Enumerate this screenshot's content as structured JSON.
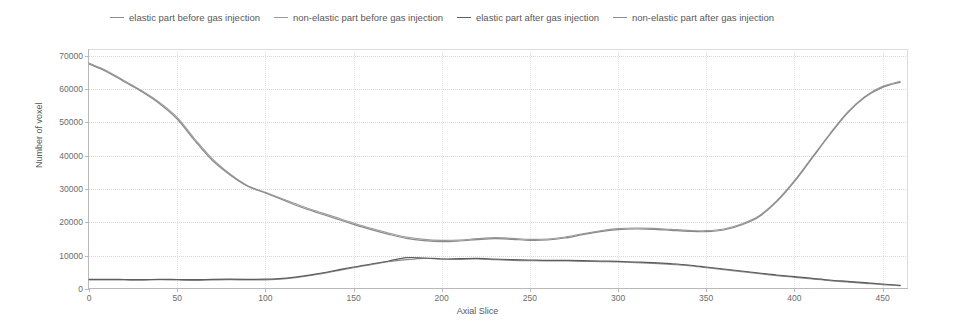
{
  "chart_data": {
    "type": "line",
    "title": "",
    "xlabel": "Axial Slice",
    "ylabel": "Number of voxel",
    "xlim": [
      0,
      465
    ],
    "ylim": [
      0,
      72000
    ],
    "xticks": [
      0,
      50,
      100,
      150,
      200,
      250,
      300,
      350,
      400,
      450
    ],
    "yticks": [
      0,
      10000,
      20000,
      30000,
      40000,
      50000,
      60000,
      70000
    ],
    "grid": true,
    "legend_position": "top",
    "series": [
      {
        "name": "elastic part before gas injection",
        "color": "#8d8d8f",
        "width": 1.1,
        "x": [
          0,
          10,
          20,
          30,
          40,
          50,
          60,
          70,
          80,
          90,
          100,
          110,
          120,
          130,
          140,
          150,
          160,
          170,
          180,
          190,
          200,
          210,
          220,
          230,
          240,
          250,
          260,
          270,
          280,
          290,
          300,
          310,
          320,
          330,
          340,
          350,
          360,
          370,
          380,
          390,
          400,
          410,
          420,
          430,
          440,
          450,
          460
        ],
        "values": [
          2700,
          2750,
          2700,
          2650,
          2800,
          2700,
          2600,
          2700,
          2800,
          2700,
          2750,
          3000,
          3600,
          4400,
          5400,
          6400,
          7300,
          8200,
          8800,
          9200,
          9000,
          8900,
          9000,
          8800,
          8600,
          8500,
          8400,
          8400,
          8300,
          8200,
          8100,
          7900,
          7700,
          7400,
          7000,
          6400,
          5800,
          5200,
          4600,
          4000,
          3500,
          3000,
          2500,
          2100,
          1700,
          1300,
          1000
        ]
      },
      {
        "name": "non-elastic part before gas injection",
        "color": "#9a9a9c",
        "width": 1.1,
        "x": [
          0,
          10,
          20,
          30,
          40,
          50,
          60,
          70,
          80,
          90,
          100,
          110,
          120,
          130,
          140,
          150,
          160,
          170,
          180,
          190,
          200,
          210,
          220,
          230,
          240,
          250,
          260,
          270,
          280,
          290,
          300,
          310,
          320,
          330,
          340,
          350,
          360,
          370,
          380,
          390,
          400,
          410,
          420,
          430,
          440,
          450,
          460
        ],
        "values": [
          67800,
          65500,
          62500,
          59500,
          56000,
          51500,
          45000,
          39000,
          34500,
          31000,
          29000,
          27000,
          25000,
          23200,
          21500,
          19800,
          18200,
          16800,
          15600,
          14900,
          14600,
          14700,
          15100,
          15400,
          15200,
          14900,
          15000,
          15600,
          16600,
          17500,
          18100,
          18300,
          18200,
          17900,
          17600,
          17500,
          18000,
          19500,
          22000,
          26500,
          32500,
          39500,
          46500,
          53000,
          57800,
          60800,
          62300
        ]
      },
      {
        "name": "elastic part after gas injection",
        "color": "#5d5d5f",
        "width": 1.2,
        "x": [
          0,
          10,
          20,
          30,
          40,
          50,
          60,
          70,
          80,
          90,
          100,
          110,
          120,
          130,
          140,
          150,
          160,
          170,
          180,
          190,
          200,
          210,
          220,
          230,
          240,
          250,
          260,
          270,
          280,
          290,
          300,
          310,
          320,
          330,
          340,
          350,
          360,
          370,
          380,
          390,
          400,
          410,
          420,
          430,
          440,
          450,
          460
        ],
        "values": [
          2900,
          2900,
          2850,
          2800,
          2900,
          2850,
          2800,
          2900,
          2950,
          2900,
          2950,
          3200,
          3800,
          4600,
          5600,
          6600,
          7500,
          8400,
          9400,
          9300,
          9000,
          9100,
          9200,
          9000,
          8800,
          8700,
          8600,
          8600,
          8500,
          8400,
          8300,
          8100,
          7900,
          7600,
          7200,
          6600,
          6000,
          5400,
          4800,
          4200,
          3700,
          3200,
          2700,
          2300,
          1900,
          1500,
          1100
        ]
      },
      {
        "name": "non-elastic part after gas injection",
        "color": "#8a8a8c",
        "width": 1.2,
        "x": [
          0,
          10,
          20,
          30,
          40,
          50,
          60,
          70,
          80,
          90,
          100,
          110,
          120,
          130,
          140,
          150,
          160,
          170,
          180,
          190,
          200,
          210,
          220,
          230,
          240,
          250,
          260,
          270,
          280,
          290,
          300,
          310,
          320,
          330,
          340,
          350,
          360,
          370,
          380,
          390,
          400,
          410,
          420,
          430,
          440,
          450,
          460
        ],
        "values": [
          67500,
          65200,
          62200,
          59200,
          55600,
          51000,
          44500,
          38500,
          34200,
          30800,
          28800,
          26700,
          24600,
          22800,
          21100,
          19400,
          17800,
          16400,
          15200,
          14500,
          14200,
          14400,
          14800,
          15100,
          14900,
          14600,
          14700,
          15300,
          16300,
          17200,
          17800,
          18000,
          17900,
          17600,
          17300,
          17200,
          17700,
          19200,
          21700,
          26200,
          32200,
          39200,
          46200,
          52700,
          57500,
          60500,
          62000
        ]
      }
    ]
  }
}
